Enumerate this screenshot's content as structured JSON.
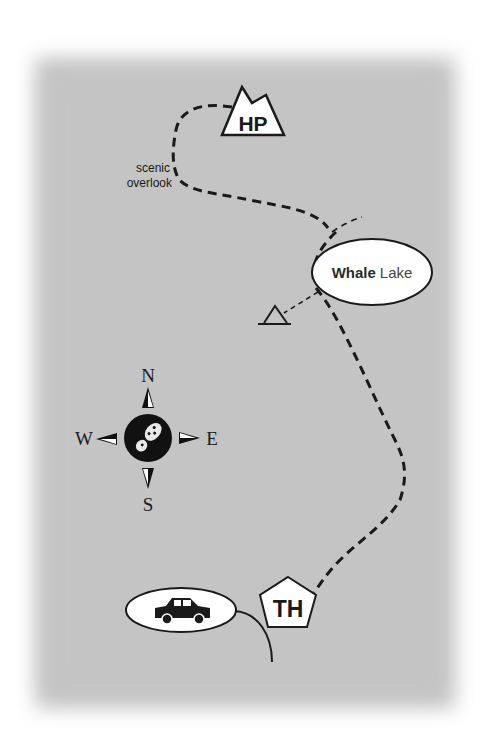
{
  "map": {
    "background_color": "#c4c4c4",
    "ink_color": "#1a1a1a",
    "landmarks": {
      "high_point": {
        "label": "HP",
        "icon": "mountain-icon"
      },
      "scenic_overlook": {
        "line1": "scenic",
        "line2": "overlook"
      },
      "lake": {
        "name_bold": "Whale",
        "name_regular": "Lake",
        "icon": "lake-ellipse"
      },
      "campsite": {
        "icon": "triangle-campsite-icon"
      },
      "trailhead": {
        "label": "TH",
        "icon": "pentagon-icon"
      },
      "parking": {
        "icon": "car-icon"
      }
    },
    "compass": {
      "north": "N",
      "south": "S",
      "east": "E",
      "west": "W",
      "center_icon": "bootprint-icon"
    },
    "trail": {
      "style": "dashed",
      "description": "Trail from TH past Whale Lake to HP via scenic overlook"
    }
  }
}
